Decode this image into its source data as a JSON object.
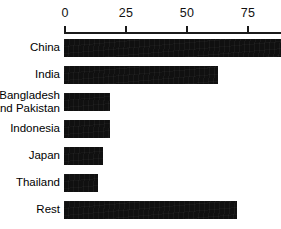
{
  "chart_data": {
    "type": "bar",
    "orientation": "horizontal",
    "title": "",
    "subtitle": "",
    "xlabel": "",
    "ylabel": "",
    "categories": [
      "China",
      "India",
      "Bangladesh\nand Pakistan",
      "Indonesia",
      "Japan",
      "Thailand",
      "Rest"
    ],
    "values": [
      89,
      63,
      19,
      19,
      16,
      14,
      71
    ],
    "xlim": [
      0,
      89
    ],
    "ticks": [
      0,
      25,
      50,
      75
    ],
    "tick_labels": [
      "0",
      "25",
      "50",
      "75"
    ],
    "grid": false,
    "legend": null,
    "bar_color": "#101010",
    "axis_color": "#1a1a1a",
    "note": "China bar extends past the plotted right edge of the image"
  },
  "axis": {
    "tick_labels": [
      "0",
      "25",
      "50",
      "75"
    ]
  },
  "rows": [
    {
      "label": "China",
      "value": 89
    },
    {
      "label": "India",
      "value": 63
    },
    {
      "label": "Bangladesh\nand Pakistan",
      "value": 19
    },
    {
      "label": "Indonesia",
      "value": 19
    },
    {
      "label": "Japan",
      "value": 16
    },
    {
      "label": "Thailand",
      "value": 14
    },
    {
      "label": "Rest",
      "value": 71
    }
  ]
}
